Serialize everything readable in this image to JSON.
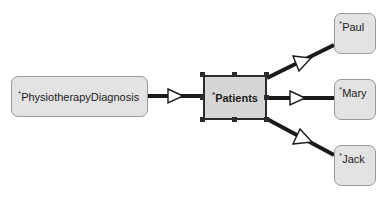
{
  "diagram": {
    "type": "uml-object-diagram",
    "background_color": "#ffffff",
    "nodes": [
      {
        "id": "diagnosis",
        "label": "PhysiotherapyDiagnosis",
        "prefix": "*",
        "shape": "rounded-rectangle",
        "fill": "#e3e3e3",
        "border": "#9a9a9a",
        "selected": false,
        "x": 11,
        "y": 76,
        "w": 137,
        "h": 41
      },
      {
        "id": "patients",
        "label": "Patients",
        "prefix": "*",
        "shape": "rectangle",
        "fill": "#d6d6d6",
        "border": "#2b2b2b",
        "selected": true,
        "bold": true,
        "x": 203,
        "y": 75,
        "w": 64,
        "h": 45
      },
      {
        "id": "paul",
        "label": "Paul",
        "prefix": "*",
        "shape": "rounded-rectangle",
        "fill": "#e3e3e3",
        "border": "#9a9a9a",
        "selected": false,
        "x": 334,
        "y": 13,
        "w": 42,
        "h": 41
      },
      {
        "id": "mary",
        "label": "Mary",
        "prefix": "*",
        "shape": "rounded-rectangle",
        "fill": "#e3e3e3",
        "border": "#9a9a9a",
        "selected": false,
        "x": 334,
        "y": 79,
        "w": 42,
        "h": 41
      },
      {
        "id": "jack",
        "label": "Jack",
        "prefix": "*",
        "shape": "rounded-rectangle",
        "fill": "#e3e3e3",
        "border": "#9a9a9a",
        "selected": false,
        "x": 334,
        "y": 145,
        "w": 42,
        "h": 41
      }
    ],
    "edges": [
      {
        "id": "diagnosis-to-patients",
        "from": "diagnosis",
        "to": "patients",
        "arrow": "hollow-triangle",
        "arrow_at": "target",
        "line_color": "#1a1a1a",
        "line_width": 4
      },
      {
        "id": "paul-to-patients",
        "from": "paul",
        "to": "patients",
        "arrow": "hollow-triangle",
        "arrow_at": "target",
        "line_color": "#1a1a1a",
        "line_width": 4
      },
      {
        "id": "patients-to-mary",
        "from": "patients",
        "to": "mary",
        "arrow": "hollow-triangle",
        "arrow_at": "target",
        "line_color": "#1a1a1a",
        "line_width": 4
      },
      {
        "id": "jack-to-patients",
        "from": "jack",
        "to": "patients",
        "arrow": "hollow-triangle",
        "arrow_at": "target",
        "line_color": "#1a1a1a",
        "line_width": 4
      }
    ],
    "selection_handles": {
      "color": "#2b2b2b",
      "count": 8
    }
  }
}
